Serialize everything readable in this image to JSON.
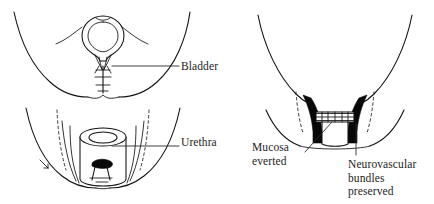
{
  "figure": {
    "background_color": "#ffffff",
    "ink_color": "#111111",
    "fill_color": "#080808",
    "text_color": "#1c1c1c",
    "width": 434,
    "height": 204
  },
  "panels": [
    {
      "id": "left-panel",
      "name": "bladder-and-urethra-panel",
      "sub_views": [
        {
          "id": "upper-view",
          "name": "bladder-neck-view",
          "structures": [
            "pelvic-sidewall-outline",
            "bladder-balloon",
            "bladder-neck-taper",
            "suture-line"
          ]
        },
        {
          "id": "lower-view",
          "name": "urethral-stump-view",
          "structures": [
            "pelvic-floor-outline",
            "urethral-cylinder",
            "urethral-lumen-ellipse",
            "clamp-instrument",
            "dissection-dashed-planes"
          ]
        }
      ]
    },
    {
      "id": "right-panel",
      "name": "anastomosis-panel",
      "structures": [
        "pelvic-funnel-outline",
        "pelvic-floor-arc",
        "neurovascular-wedge-left",
        "neurovascular-wedge-right",
        "anastomotic-suture-band",
        "urethral-stump-box",
        "dissection-dashed-planes"
      ]
    }
  ],
  "labels": [
    {
      "id": "bladder",
      "name": "label-bladder",
      "text": "Bladder",
      "lines": [
        "Bladder"
      ],
      "leader": "horizontal-left"
    },
    {
      "id": "urethra",
      "name": "label-urethra",
      "text": "Urethra",
      "lines": [
        "Urethra"
      ],
      "leader": "horizontal-left"
    },
    {
      "id": "mucosa-everted",
      "name": "label-mucosa-everted",
      "text": "Mucosa everted",
      "lines": [
        "Mucosa",
        "everted"
      ],
      "leader": "diagonal-up-right"
    },
    {
      "id": "neurovascular-bundles-preserved",
      "name": "label-neurovascular-bundles",
      "text": "Neurovascular bundles preserved",
      "lines": [
        "Neurovascular",
        "bundles",
        "preserved"
      ],
      "leader": "vertical-up"
    }
  ]
}
